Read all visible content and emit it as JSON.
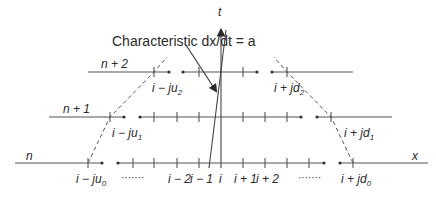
{
  "diagram": {
    "title_annotation": "Characteristic dx/dt = a",
    "axes": {
      "time_label": "t",
      "space_label": "x"
    },
    "rows": [
      {
        "id": "n",
        "label": "n"
      },
      {
        "id": "n+1",
        "label": "n + 1"
      },
      {
        "id": "n+2",
        "label": "n + 2"
      }
    ],
    "bottom_tick_labels": [
      "i − ju0",
      "……",
      "i − 2",
      "i − 1",
      "i",
      "i + 1",
      "i + 2",
      "……",
      "i + jd0"
    ],
    "left_domain_labels": [
      "i − ju0",
      "i − ju1",
      "i − ju2"
    ],
    "right_domain_labels": [
      "i + jd0",
      "i + jd1",
      "i + jd2"
    ],
    "colors": {
      "line": "#3a3a3a",
      "text": "#2a2a2a",
      "background": "#ffffff"
    }
  },
  "labels": {
    "characteristic": "Characteristic dx/dt = a",
    "t": "t",
    "x": "x",
    "n": "n",
    "n1": "n + 1",
    "n2": "n + 2",
    "lju0": "i − ju",
    "lju0_sub": "0",
    "lju1": "i − ju",
    "lju1_sub": "1",
    "lju2": "i − ju",
    "lju2_sub": "2",
    "rjd0": "i + jd",
    "rjd0_sub": "0",
    "rjd1": "i + jd",
    "rjd1_sub": "1",
    "rjd2": "i + jd",
    "rjd2_sub": "2",
    "im2": "i − 2",
    "im1": "i − 1",
    "i": "i",
    "ip1": "i + 1",
    "ip2": "i + 2",
    "dots_left": "·······",
    "dots_right": "·······"
  }
}
